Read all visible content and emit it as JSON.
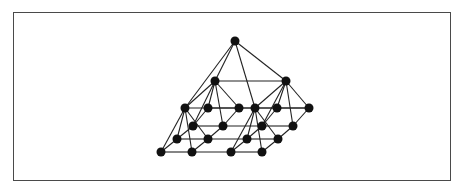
{
  "diagram": {
    "title": "",
    "type": "pyramid-graph",
    "colors": {
      "node": "#111111",
      "edge": "#222222",
      "border": "#4a4a4a",
      "background": "#ffffff"
    },
    "node_radius": 4.5,
    "nodes": [
      {
        "id": "top",
        "x": 235,
        "y": 41
      },
      {
        "id": "l2a",
        "x": 215,
        "y": 81
      },
      {
        "id": "l2b",
        "x": 286,
        "y": 81
      },
      {
        "id": "l3a",
        "x": 185,
        "y": 108
      },
      {
        "id": "l3b",
        "x": 255,
        "y": 108
      },
      {
        "id": "b00",
        "x": 208,
        "y": 108
      },
      {
        "id": "b01",
        "x": 239,
        "y": 108
      },
      {
        "id": "b02",
        "x": 277,
        "y": 108
      },
      {
        "id": "b03",
        "x": 309,
        "y": 108
      },
      {
        "id": "b10",
        "x": 193,
        "y": 126
      },
      {
        "id": "b11",
        "x": 223,
        "y": 126
      },
      {
        "id": "b12",
        "x": 262,
        "y": 126
      },
      {
        "id": "b13",
        "x": 293,
        "y": 126
      },
      {
        "id": "b20",
        "x": 177,
        "y": 139
      },
      {
        "id": "b21",
        "x": 208,
        "y": 139
      },
      {
        "id": "b22",
        "x": 247,
        "y": 139
      },
      {
        "id": "b23",
        "x": 278,
        "y": 139
      },
      {
        "id": "b30",
        "x": 161,
        "y": 152
      },
      {
        "id": "b31",
        "x": 192,
        "y": 152
      },
      {
        "id": "b32",
        "x": 231,
        "y": 152
      },
      {
        "id": "b33",
        "x": 262,
        "y": 152
      }
    ],
    "edges": [
      [
        "top",
        "l2a"
      ],
      [
        "top",
        "l2b"
      ],
      [
        "top",
        "l3a"
      ],
      [
        "top",
        "l3b"
      ],
      [
        "l2a",
        "l2b"
      ],
      [
        "l2a",
        "l3a"
      ],
      [
        "l2a",
        "b00"
      ],
      [
        "l2a",
        "b01"
      ],
      [
        "l2a",
        "b10"
      ],
      [
        "l2a",
        "b11"
      ],
      [
        "l2b",
        "l3b"
      ],
      [
        "l2b",
        "b02"
      ],
      [
        "l2b",
        "b03"
      ],
      [
        "l2b",
        "b12"
      ],
      [
        "l2b",
        "b13"
      ],
      [
        "l3a",
        "l3b"
      ],
      [
        "l3b",
        "b03"
      ],
      [
        "l3a",
        "b20"
      ],
      [
        "l3a",
        "b21"
      ],
      [
        "l3a",
        "b30"
      ],
      [
        "l3a",
        "b31"
      ],
      [
        "l3b",
        "b22"
      ],
      [
        "l3b",
        "b23"
      ],
      [
        "l3b",
        "b32"
      ],
      [
        "l3b",
        "b33"
      ],
      [
        "b00",
        "b01"
      ],
      [
        "b01",
        "b02"
      ],
      [
        "b02",
        "b03"
      ],
      [
        "b10",
        "b11"
      ],
      [
        "b11",
        "b12"
      ],
      [
        "b12",
        "b13"
      ],
      [
        "b20",
        "b21"
      ],
      [
        "b21",
        "b22"
      ],
      [
        "b22",
        "b23"
      ],
      [
        "b30",
        "b31"
      ],
      [
        "b31",
        "b32"
      ],
      [
        "b32",
        "b33"
      ],
      [
        "b00",
        "b10"
      ],
      [
        "b10",
        "b20"
      ],
      [
        "b20",
        "b30"
      ],
      [
        "b01",
        "b11"
      ],
      [
        "b11",
        "b21"
      ],
      [
        "b21",
        "b31"
      ],
      [
        "b02",
        "b12"
      ],
      [
        "b12",
        "b22"
      ],
      [
        "b22",
        "b32"
      ],
      [
        "b03",
        "b13"
      ],
      [
        "b13",
        "b23"
      ],
      [
        "b23",
        "b33"
      ]
    ]
  }
}
